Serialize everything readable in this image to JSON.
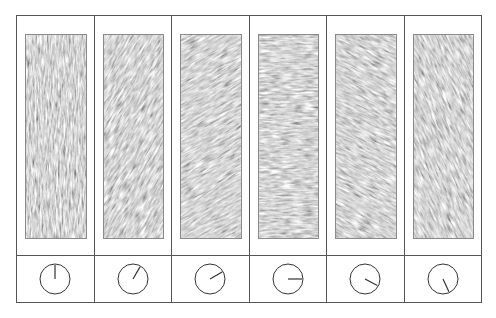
{
  "figure": {
    "border_color": "#555555",
    "texture_base_color": "#a8a8a8",
    "dial_stroke_color": "#333333"
  },
  "panels": [
    {
      "id": 1,
      "orientation_deg": 0,
      "label": "0°"
    },
    {
      "id": 2,
      "orientation_deg": 30,
      "label": "30°"
    },
    {
      "id": 3,
      "orientation_deg": 60,
      "label": "60°"
    },
    {
      "id": 4,
      "orientation_deg": 90,
      "label": "90°"
    },
    {
      "id": 5,
      "orientation_deg": 118,
      "label": "118°"
    },
    {
      "id": 6,
      "orientation_deg": 155,
      "label": "155°"
    }
  ]
}
